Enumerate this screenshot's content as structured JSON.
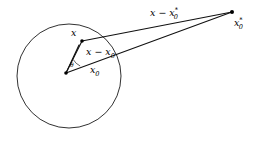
{
  "figure": {
    "title": "",
    "background_color": "#ffffff",
    "stroke_color": "#111111",
    "labels": {
      "point_x": "x",
      "point_x0": "x",
      "point_x0_sub": "0",
      "point_x0star_base": "x",
      "point_x0star_sub": "0",
      "point_x0star_star": "*",
      "seg_x_minus_x0_base": "x",
      "seg_x_minus_x0_op": " − ",
      "seg_x_minus_x0_tail": "x",
      "seg_x_minus_x0_sub": "0",
      "seg_x_minus_x0star_base": "x",
      "seg_x_minus_x0star_op": " − ",
      "seg_x_minus_x0star_tail": "x",
      "seg_x_minus_x0star_sub": "0",
      "seg_x_minus_x0star_star": "*",
      "angle": "θ"
    },
    "geometry": {
      "circle": {
        "cx": 69,
        "cy": 76,
        "r": 52
      },
      "points": {
        "x": {
          "x": 82,
          "y": 41
        },
        "x0": {
          "x": 66,
          "y": 73
        },
        "x0star": {
          "x": 232,
          "y": 12
        }
      },
      "segments": [
        {
          "name": "x-to-x0",
          "from": "x",
          "to": "x0"
        },
        {
          "name": "x0-to-x0star",
          "from": "x0",
          "to": "x0star"
        },
        {
          "name": "x-to-x0star",
          "from": "x",
          "to": "x0star"
        },
        {
          "name": "x0-to-edge",
          "from": "x0",
          "to": "circle-edge"
        }
      ]
    }
  }
}
